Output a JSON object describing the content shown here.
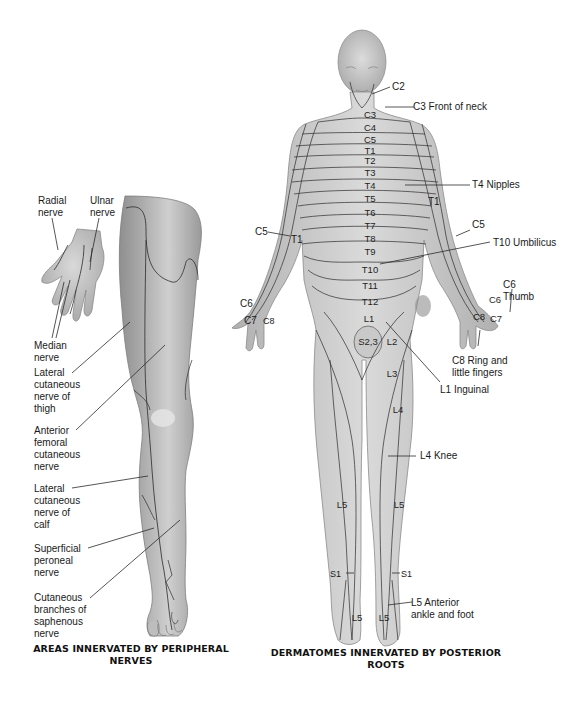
{
  "figure": {
    "left_panel": {
      "caption_line1": "AREAS INNERVATED BY PERIPHERAL",
      "caption_line2": "NERVES",
      "labels": {
        "radial_nerve_1": "Radial",
        "radial_nerve_2": "nerve",
        "ulnar_nerve_1": "Ulnar",
        "ulnar_nerve_2": "nerve",
        "median_nerve_1": "Median",
        "median_nerve_2": "nerve",
        "lat_cut_thigh_1": "Lateral",
        "lat_cut_thigh_2": "cutaneous",
        "lat_cut_thigh_3": "nerve of",
        "lat_cut_thigh_4": "thigh",
        "ant_fem_1": "Anterior",
        "ant_fem_2": "femoral",
        "ant_fem_3": "cutaneous",
        "ant_fem_4": "nerve",
        "lat_cut_calf_1": "Lateral",
        "lat_cut_calf_2": "cutaneous",
        "lat_cut_calf_3": "nerve of",
        "lat_cut_calf_4": "calf",
        "sup_peroneal_1": "Superficial",
        "sup_peroneal_2": "peroneal",
        "sup_peroneal_3": "nerve",
        "saphenous_1": "Cutaneous",
        "saphenous_2": "branches of",
        "saphenous_3": "saphenous",
        "saphenous_4": "nerve"
      }
    },
    "right_panel": {
      "caption_line1": "DERMATOMES INNERVATED BY POSTERIOR",
      "caption_line2": "ROOTS",
      "callouts": {
        "c2": "C2",
        "c3_neck": "C3 Front of neck",
        "t4_nipples": "T4 Nipples",
        "t1_right": "T1",
        "c5_right": "C5",
        "t10_umbilicus": "T10 Umbilicus",
        "c6_thumb_1": "C6",
        "c6_thumb_2": "Thumb",
        "c8_ring_1": "C8 Ring and",
        "c8_ring_2": "little fingers",
        "l1_inguinal": "L1 Inguinal",
        "l4_knee": "L4 Knee",
        "l5_ankle_1": "L5 Anterior",
        "l5_ankle_2": "ankle and foot",
        "c5_left": "C5",
        "t1_left": "T1",
        "c6_left": "C6",
        "c7_left": "C7",
        "c8_left": "C8",
        "s1_left": "S1",
        "s1_right": "S1"
      },
      "segments": {
        "trunk": [
          "C3",
          "C4",
          "C5",
          "T1",
          "T2",
          "T3",
          "T4",
          "T5",
          "T6",
          "T7",
          "T8",
          "T9",
          "T10",
          "T11",
          "T12",
          "L1"
        ],
        "s23": "S2,3",
        "l2": "L2",
        "l3": "L3",
        "l4": "L4",
        "l5_left_leg": "L5",
        "l5_right_leg": "L5",
        "l5_left_foot": "L5",
        "l5_right_foot": "L5",
        "c6_right_hand": "C6",
        "c7_right_hand": "C7",
        "c8_right_hand": "C8"
      }
    },
    "colors": {
      "skin_light": "#d6d6d6",
      "skin_mid": "#b9b9b9",
      "skin_dark": "#8e8e8e",
      "line": "#2b2b2b",
      "background": "#ffffff"
    }
  }
}
